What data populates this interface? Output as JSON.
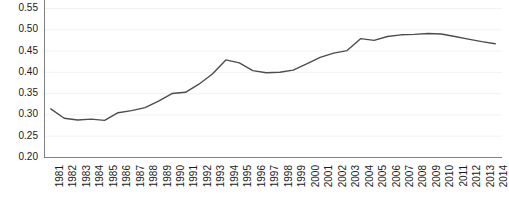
{
  "chart_data": {
    "type": "line",
    "title": "",
    "subtitle": "",
    "xlabel": "",
    "ylabel": "",
    "categories": [
      "1981",
      "1982",
      "1983",
      "1984",
      "1985",
      "1986",
      "1987",
      "1988",
      "1989",
      "1990",
      "1991",
      "1992",
      "1993",
      "1994",
      "1995",
      "1996",
      "1997",
      "1998",
      "1999",
      "2000",
      "2001",
      "2002",
      "2003",
      "2004",
      "2005",
      "2006",
      "2007",
      "2008",
      "2009",
      "2010",
      "2011",
      "2012",
      "2013",
      "2014"
    ],
    "values": [
      0.313,
      0.291,
      0.287,
      0.289,
      0.286,
      0.304,
      0.309,
      0.316,
      0.331,
      0.349,
      0.352,
      0.371,
      0.395,
      0.428,
      0.421,
      0.403,
      0.398,
      0.399,
      0.404,
      0.419,
      0.434,
      0.444,
      0.45,
      0.478,
      0.474,
      0.483,
      0.487,
      0.488,
      0.49,
      0.489,
      0.483,
      0.477,
      0.471,
      0.466
    ],
    "series": [
      {
        "name": "series-1",
        "color": "#4d4d4d",
        "values": [
          0.313,
          0.291,
          0.287,
          0.289,
          0.286,
          0.304,
          0.309,
          0.316,
          0.331,
          0.349,
          0.352,
          0.371,
          0.395,
          0.428,
          0.421,
          0.403,
          0.398,
          0.399,
          0.404,
          0.419,
          0.434,
          0.444,
          0.45,
          0.478,
          0.474,
          0.483,
          0.487,
          0.488,
          0.49,
          0.489,
          0.483,
          0.477,
          0.471,
          0.466
        ]
      }
    ],
    "ylim": [
      0.2,
      0.55
    ],
    "ytick_values": [
      0.2,
      0.25,
      0.3,
      0.35,
      0.4,
      0.45,
      0.5,
      0.55
    ],
    "ytick_labels": [
      "0.20",
      "0.25",
      "0.30",
      "0.35",
      "0.40",
      "0.45",
      "0.50",
      "0.55"
    ],
    "xtick_labels": [
      "1981",
      "1982",
      "1983",
      "1984",
      "1985",
      "1986",
      "1987",
      "1988",
      "1989",
      "1990",
      "1991",
      "1992",
      "1993",
      "1994",
      "1995",
      "1996",
      "1997",
      "1998",
      "1999",
      "2000",
      "2001",
      "2002",
      "2003",
      "2004",
      "2005",
      "2006",
      "2007",
      "2008",
      "2009",
      "2010",
      "2011",
      "2012",
      "2013",
      "2014"
    ],
    "grid": true,
    "grid_axis": "y",
    "grid_color": "#f2f2f2",
    "axis_color": "#808080",
    "legend": false,
    "legend_position": "none"
  }
}
